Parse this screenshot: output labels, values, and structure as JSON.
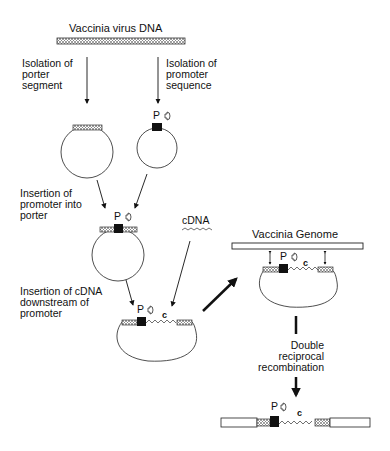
{
  "diagram": {
    "title": "Vaccinia virus DNA",
    "steps": {
      "porter": "Isolation of\nporter\nsegment",
      "promoter": "Isolation of\npromoter\nsequence",
      "insert_promoter": "Insertion of\npromoter into\nporter",
      "insert_cdna": "Insertion of cDNA\ndownstream of\npromoter",
      "recombination": "Double\nreciprocal\nrecombination"
    },
    "labels": {
      "cdna": "cDNA",
      "genome": "Vaccinia Genome",
      "promoter_symbol": "P",
      "cdna_symbol": "c"
    },
    "colors": {
      "line": "#111111",
      "hatch": "#888888",
      "background": "#ffffff"
    }
  }
}
